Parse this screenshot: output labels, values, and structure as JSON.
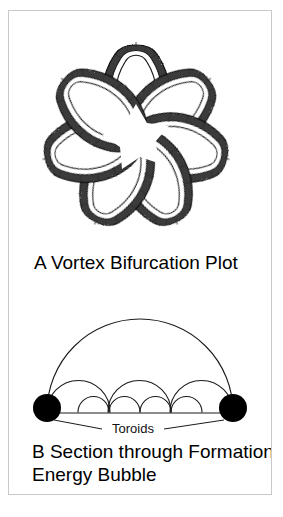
{
  "figure": {
    "panel_a": {
      "label": "A  Vortex Bifurcation Plot",
      "petal_count": 7,
      "style": "hand-drawn shaded tube loops arranged radially around a white star-shaped center"
    },
    "panel_b": {
      "label_line1": "B  Section through Formation",
      "label_line2": "Energy Bubble",
      "toroids_label": "Toroids",
      "toroid_count": 2,
      "large_arc_count": 1,
      "medium_arc_count": 3,
      "small_arc_count": 4
    },
    "scan_bleed_text": ""
  },
  "colors": {
    "ink": "#000000",
    "border": "#c9c9c9",
    "shade_dark": "#2b2b2b",
    "shade_mid": "#7a7a7a",
    "shade_light": "#efefef",
    "background": "#ffffff"
  }
}
